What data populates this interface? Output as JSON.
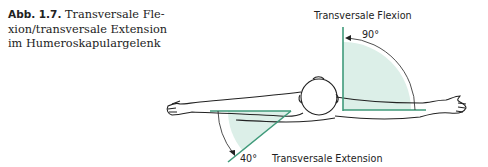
{
  "caption": {
    "label": "Abb. 1.7.",
    "text": " Transversale Flexion/transversale Extension im Humeroskapulargelenk",
    "lines": [
      "Transversale Fle-",
      "xion/transversale Extension",
      "im Humeroskapulargelenk"
    ]
  },
  "figure": {
    "flexion_label": "Transversale Flexion",
    "flexion_angle": "90°",
    "extension_label": "Transversale Extension",
    "extension_angle": "40°",
    "colors": {
      "line": "#3f9a7a",
      "fill": "#dcefe8",
      "ink": "#222222"
    }
  }
}
